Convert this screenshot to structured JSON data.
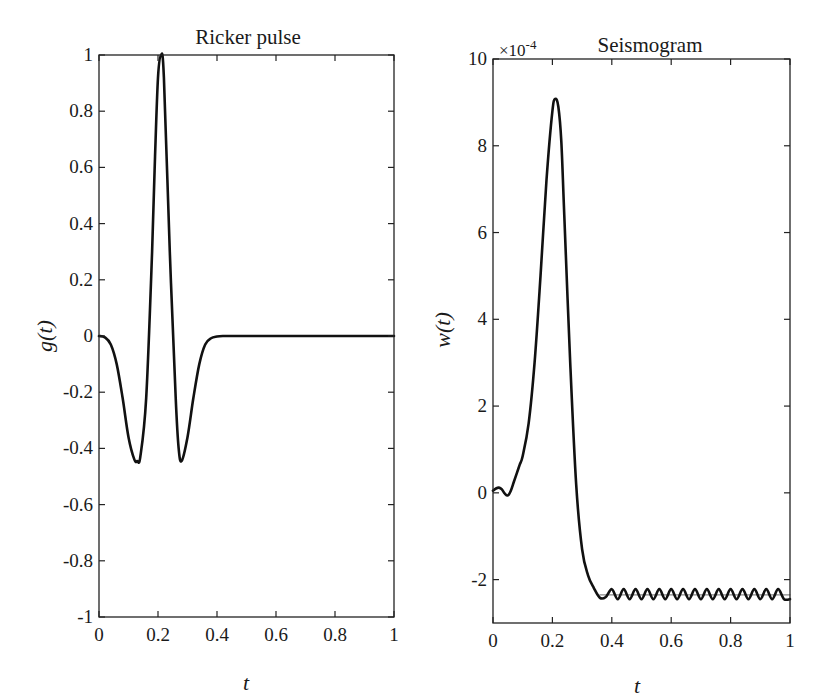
{
  "chart_data": [
    {
      "type": "line",
      "title": "Ricker pulse",
      "xlabel": "t",
      "ylabel": "g(t)",
      "xlim": [
        0,
        1
      ],
      "ylim": [
        -1,
        1
      ],
      "grid": false,
      "legend": null,
      "xticks": [
        "0",
        "0.2",
        "0.4",
        "0.6",
        "0.8",
        "1"
      ],
      "yticks": [
        "-1",
        "-0.8",
        "-0.6",
        "-0.4",
        "-0.2",
        "0",
        "0.2",
        "0.4",
        "0.6",
        "0.8",
        "1"
      ],
      "series": [
        {
          "name": "g(t)",
          "color": "#111111",
          "x": [
            0,
            0.02,
            0.04,
            0.06,
            0.08,
            0.1,
            0.12,
            0.13,
            0.14,
            0.16,
            0.18,
            0.19,
            0.2,
            0.21,
            0.22,
            0.24,
            0.26,
            0.27,
            0.28,
            0.3,
            0.32,
            0.34,
            0.36,
            0.38,
            0.4,
            0.42,
            0.45,
            0.5,
            0.6,
            0.7,
            0.8,
            0.9,
            1.0
          ],
          "y": [
            0,
            -0.005,
            -0.03,
            -0.1,
            -0.22,
            -0.36,
            -0.44,
            -0.445,
            -0.43,
            -0.22,
            0.3,
            0.64,
            0.92,
            1.0,
            0.92,
            0.3,
            -0.22,
            -0.4,
            -0.445,
            -0.36,
            -0.22,
            -0.1,
            -0.03,
            -0.008,
            -0.002,
            0,
            0,
            0,
            0,
            0,
            0,
            0,
            0
          ]
        }
      ]
    },
    {
      "type": "line",
      "title": "Seismogram",
      "xlabel": "t",
      "ylabel": "w(t)",
      "y_scale_label": "×10^-4",
      "xlim": [
        0,
        1
      ],
      "ylim": [
        -3,
        10
      ],
      "grid": false,
      "legend": null,
      "xticks": [
        "0",
        "0.2",
        "0.4",
        "0.6",
        "0.8",
        "1"
      ],
      "yticks": [
        "-2",
        "0",
        "2",
        "4",
        "6",
        "8",
        "10"
      ],
      "series": [
        {
          "name": "w(t) numerical",
          "color": "#111111",
          "x": [
            0,
            0.01,
            0.02,
            0.03,
            0.04,
            0.05,
            0.06,
            0.07,
            0.08,
            0.09,
            0.1,
            0.12,
            0.14,
            0.16,
            0.18,
            0.2,
            0.21,
            0.22,
            0.23,
            0.24,
            0.26,
            0.28,
            0.3,
            0.32,
            0.34,
            0.36,
            0.38,
            0.4,
            0.42,
            0.44,
            0.46,
            0.48,
            0.5,
            0.52,
            0.54,
            0.56,
            0.58,
            0.6,
            0.62,
            0.64,
            0.66,
            0.68,
            0.7,
            0.72,
            0.74,
            0.76,
            0.78,
            0.8,
            0.82,
            0.84,
            0.86,
            0.88,
            0.9,
            0.92,
            0.94,
            0.96,
            0.98,
            1.0
          ],
          "y": [
            0.05,
            0.1,
            0.12,
            0.08,
            -0.02,
            -0.06,
            0.05,
            0.25,
            0.45,
            0.65,
            0.85,
            1.6,
            3.0,
            5.0,
            7.2,
            8.8,
            9.08,
            8.9,
            8.1,
            6.4,
            3.0,
            0.2,
            -1.3,
            -1.9,
            -2.2,
            -2.42,
            -2.4,
            -2.22,
            -2.45,
            -2.22,
            -2.45,
            -2.22,
            -2.45,
            -2.22,
            -2.45,
            -2.22,
            -2.45,
            -2.22,
            -2.45,
            -2.22,
            -2.45,
            -2.22,
            -2.45,
            -2.22,
            -2.45,
            -2.22,
            -2.45,
            -2.22,
            -2.45,
            -2.22,
            -2.45,
            -2.22,
            -2.45,
            -2.22,
            -2.45,
            -2.22,
            -2.45,
            -2.45
          ]
        },
        {
          "name": "w(t) reference",
          "color": "#888888",
          "x": [
            0.36,
            1.0
          ],
          "y": [
            -2.35,
            -2.35
          ]
        }
      ]
    }
  ]
}
